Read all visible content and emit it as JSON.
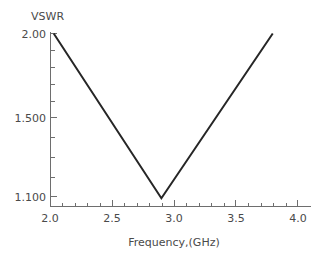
{
  "chart_data": {
    "type": "line",
    "title": "",
    "xlabel": "Frequency,(GHz)",
    "ylabel": "VSWR",
    "xlim": [
      1.93,
      4.07
    ],
    "ylim": [
      1.07,
      2.03
    ],
    "grid": false,
    "legend": null,
    "x_ticks": [
      {
        "value": 2.0,
        "label": "2.0"
      },
      {
        "value": 2.5,
        "label": "2.5"
      },
      {
        "value": 3.0,
        "label": "3.0"
      },
      {
        "value": 3.5,
        "label": "3.5"
      },
      {
        "value": 4.0,
        "label": "4.0"
      }
    ],
    "x_minor_ticks": [
      2.1,
      2.2,
      2.3,
      2.4,
      2.6,
      2.7,
      2.8,
      2.9,
      3.1,
      3.2,
      3.3,
      3.4,
      3.6,
      3.7,
      3.8,
      3.9
    ],
    "y_ticks": [
      {
        "value": 2.0,
        "label": "2.00"
      },
      {
        "value": 1.5,
        "label": "1.500"
      },
      {
        "value": 1.1,
        "label": "1.100"
      }
    ],
    "y_minor_ticks": [
      1.9,
      1.8,
      1.7,
      1.6,
      1.4,
      1.3,
      1.2
    ],
    "series": [
      {
        "name": "VSWR",
        "color": "#262626",
        "x": [
          2.03,
          2.9,
          3.8
        ],
        "y": [
          2.0,
          1.09,
          2.0
        ]
      }
    ],
    "annotations": []
  },
  "axes": {
    "axis_color": "#6e6e6e",
    "label_color": "#4a4a4a"
  }
}
